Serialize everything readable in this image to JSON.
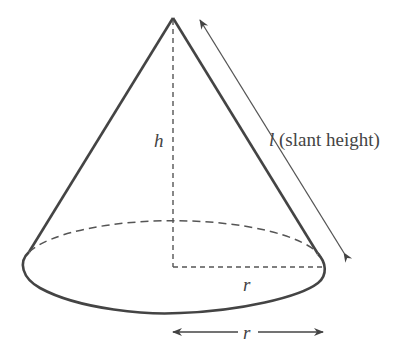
{
  "diagram": {
    "labels": {
      "height": "h",
      "slant_var": "l",
      "slant_text": " (slant height)",
      "radius_inner": "r",
      "radius_dim": "r"
    },
    "colors": {
      "outline": "#444444",
      "dashed": "#555555",
      "text": "#444444",
      "background": "#ffffff"
    }
  }
}
